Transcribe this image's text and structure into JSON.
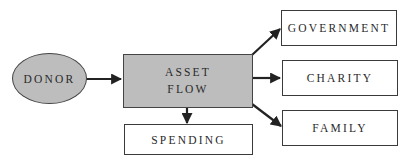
{
  "diagram": {
    "type": "flow",
    "source": {
      "label": "DONOR",
      "shape": "ellipse",
      "fill": "#bdbdbd"
    },
    "hub": {
      "label_line1": "ASSET",
      "label_line2": "FLOW",
      "shape": "rectangle",
      "fill": "#bdbdbd"
    },
    "destinations": [
      {
        "label": "GOVERNMENT"
      },
      {
        "label": "CHARITY"
      },
      {
        "label": "FAMILY"
      },
      {
        "label": "SPENDING"
      }
    ],
    "edges": [
      {
        "from": "DONOR",
        "to": "ASSET FLOW"
      },
      {
        "from": "ASSET FLOW",
        "to": "GOVERNMENT"
      },
      {
        "from": "ASSET FLOW",
        "to": "CHARITY"
      },
      {
        "from": "ASSET FLOW",
        "to": "FAMILY"
      },
      {
        "from": "ASSET FLOW",
        "to": "SPENDING"
      }
    ],
    "colors": {
      "node_fill": "#bdbdbd",
      "stroke": "#222222",
      "box_fill": "#ffffff"
    }
  }
}
